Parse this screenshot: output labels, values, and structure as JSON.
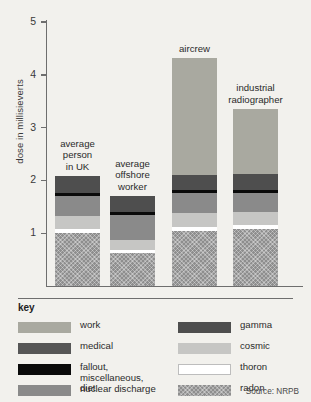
{
  "chart_data": {
    "type": "bar",
    "subtype": "stacked-bar",
    "title": "",
    "xlabel": "",
    "ylabel": "dose in millisieverts",
    "ylim": [
      0,
      5
    ],
    "yticks": [
      1,
      2,
      3,
      4,
      5
    ],
    "grid": false,
    "legend_position": "below-plot",
    "source": "Source: NRPB",
    "categories": [
      "average person in UK",
      "average offshore worker",
      "aircrew",
      "industrial radiographer"
    ],
    "category_labels": [
      "average\nperson\nin UK",
      "average\noffshore\nworker",
      "aircrew",
      "industrial\nradiographer"
    ],
    "series": [
      {
        "name": "radon",
        "color": "#8e8e8e",
        "hatched": true,
        "values": [
          1.0,
          0.62,
          1.05,
          1.08
        ]
      },
      {
        "name": "thoron",
        "color": "#ffffff",
        "hatched": false,
        "values": [
          0.07,
          0.07,
          0.07,
          0.07
        ]
      },
      {
        "name": "cosmic",
        "color": "#c6c6c4",
        "hatched": false,
        "values": [
          0.26,
          0.18,
          0.26,
          0.26
        ]
      },
      {
        "name": "diet",
        "color": "#8a8a8a",
        "hatched": false,
        "values": [
          0.38,
          0.48,
          0.38,
          0.36
        ]
      },
      {
        "name": "fallout, miscellaneous, nuclear discharge",
        "color": "#0a0a0a",
        "hatched": false,
        "values": [
          0.05,
          0.05,
          0.05,
          0.05
        ]
      },
      {
        "name": "medical",
        "color": "#565656",
        "hatched": false,
        "values": [
          0.32,
          0.3,
          0.3,
          0.3
        ]
      },
      {
        "name": "work",
        "color": "#a9a9a0",
        "hatched": false,
        "values": [
          0.0,
          0.0,
          2.2,
          1.23
        ]
      }
    ],
    "totals": [
      2.08,
      1.7,
      4.31,
      3.35
    ],
    "legend": {
      "title": "key",
      "left_column": [
        {
          "label": "work",
          "color": "#a9a9a0",
          "hatched": false
        },
        {
          "label": "medical",
          "color": "#565656",
          "hatched": false
        },
        {
          "label": "fallout, miscellaneous,\nnuclear discharge",
          "color": "#0a0a0a",
          "hatched": false
        },
        {
          "label": "diet",
          "color": "#8a8a8a",
          "hatched": false
        }
      ],
      "right_column": [
        {
          "label": "gamma",
          "color": "#4e4e4e",
          "hatched": false
        },
        {
          "label": "cosmic",
          "color": "#c6c6c4",
          "hatched": false
        },
        {
          "label": "thoron",
          "color": "#ffffff",
          "hatched": false
        },
        {
          "label": "radon",
          "color": "#8e8e8e",
          "hatched": true
        }
      ]
    }
  },
  "axis": {
    "y_title": "dose in millisieverts",
    "ticks": [
      "5",
      "4",
      "3",
      "2",
      "1"
    ]
  },
  "bars": [
    {
      "label": "average\nperson\nin UK",
      "segments": [
        {
          "name": "gamma",
          "color": "#4e4e4e",
          "value": 0.32
        },
        {
          "name": "fallout",
          "color": "#0a0a0a",
          "value": 0.05
        },
        {
          "name": "diet",
          "color": "#8a8a8a",
          "value": 0.38
        },
        {
          "name": "cosmic",
          "color": "#c6c6c4",
          "value": 0.26
        },
        {
          "name": "thoron",
          "color": "#ffffff",
          "value": 0.07
        },
        {
          "name": "radon",
          "color": "#8e8e8e",
          "value": 1.0
        }
      ]
    },
    {
      "label": "average\noffshore\nworker",
      "segments": [
        {
          "name": "gamma",
          "color": "#4e4e4e",
          "value": 0.3
        },
        {
          "name": "fallout",
          "color": "#0a0a0a",
          "value": 0.05
        },
        {
          "name": "diet",
          "color": "#8a8a8a",
          "value": 0.48
        },
        {
          "name": "cosmic",
          "color": "#c6c6c4",
          "value": 0.18
        },
        {
          "name": "thoron",
          "color": "#ffffff",
          "value": 0.07
        },
        {
          "name": "radon",
          "color": "#8e8e8e",
          "value": 0.62
        }
      ]
    },
    {
      "label": "aircrew",
      "segments": [
        {
          "name": "work",
          "color": "#a9a9a0",
          "value": 2.2
        },
        {
          "name": "gamma",
          "color": "#4e4e4e",
          "value": 0.3
        },
        {
          "name": "fallout",
          "color": "#0a0a0a",
          "value": 0.05
        },
        {
          "name": "diet",
          "color": "#8a8a8a",
          "value": 0.38
        },
        {
          "name": "cosmic",
          "color": "#c6c6c4",
          "value": 0.26
        },
        {
          "name": "thoron",
          "color": "#ffffff",
          "value": 0.07
        },
        {
          "name": "radon",
          "color": "#8e8e8e",
          "value": 1.05
        }
      ]
    },
    {
      "label": "industrial\nradiographer",
      "segments": [
        {
          "name": "work",
          "color": "#a9a9a0",
          "value": 1.23
        },
        {
          "name": "gamma",
          "color": "#4e4e4e",
          "value": 0.3
        },
        {
          "name": "fallout",
          "color": "#0a0a0a",
          "value": 0.05
        },
        {
          "name": "diet",
          "color": "#8a8a8a",
          "value": 0.36
        },
        {
          "name": "cosmic",
          "color": "#c6c6c4",
          "value": 0.26
        },
        {
          "name": "thoron",
          "color": "#ffffff",
          "value": 0.07
        },
        {
          "name": "radon",
          "color": "#8e8e8e",
          "value": 1.08
        }
      ]
    }
  ],
  "key": {
    "title": "key",
    "source": "Source: NRPB"
  }
}
